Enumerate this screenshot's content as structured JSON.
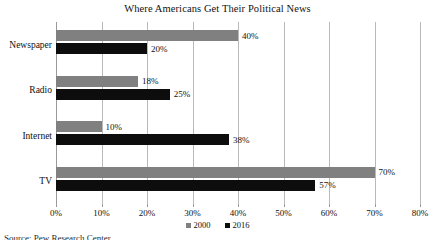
{
  "chart_data": {
    "type": "bar",
    "orientation": "horizontal",
    "title": "Where Americans Get Their Political News",
    "xlabel": "",
    "ylabel": "",
    "categories": [
      "Newspaper",
      "Radio",
      "Internet",
      "TV"
    ],
    "series": [
      {
        "name": "2000",
        "color": "#808080",
        "values": [
          40,
          18,
          10,
          70
        ],
        "labels": [
          "40%",
          "18%",
          "10%",
          "70%"
        ]
      },
      {
        "name": "2016",
        "color": "#0d0d0d",
        "values": [
          20,
          25,
          38,
          57
        ],
        "labels": [
          "20%",
          "25%",
          "38%",
          "57%"
        ]
      }
    ],
    "xlim": [
      0,
      80
    ],
    "xticks": [
      0,
      10,
      20,
      30,
      40,
      50,
      60,
      70,
      80
    ],
    "xtick_labels": [
      "0%",
      "10%",
      "20%",
      "30%",
      "40%",
      "50%",
      "60%",
      "70%",
      "80%"
    ],
    "grid": true,
    "grid_axis": "x",
    "legend_position": "bottom-center"
  },
  "footer": {
    "source_note": "Source: Pew Research Center"
  }
}
